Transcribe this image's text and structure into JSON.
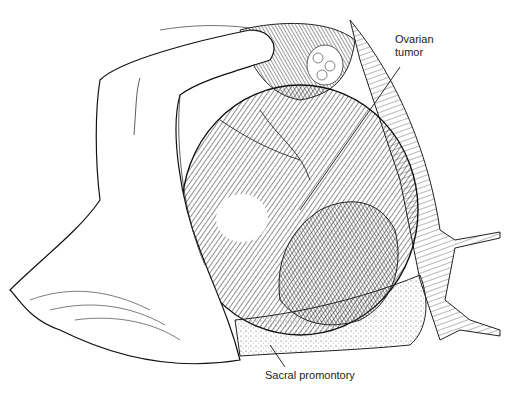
{
  "figure": {
    "stroke_color": "#1a1a1a",
    "background": "#ffffff"
  },
  "labels": {
    "ovarian_tumor_line1": "Ovarian",
    "ovarian_tumor_line2": "tumor",
    "sacral_promontory": "Sacral promontory"
  }
}
